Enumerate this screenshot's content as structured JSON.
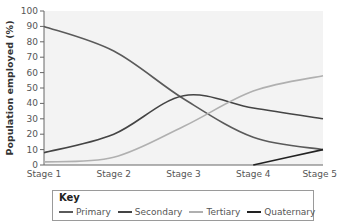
{
  "chart_data": {
    "type": "line",
    "title": "",
    "xlabel": "",
    "ylabel": "Population employed (%)",
    "ylim": [
      0,
      100
    ],
    "yticks": [
      0,
      10,
      20,
      30,
      40,
      50,
      60,
      70,
      80,
      90,
      100
    ],
    "categories": [
      "Stage 1",
      "Stage 2",
      "Stage 3",
      "Stage 4",
      "Stage 5"
    ],
    "grid": false,
    "legend_position": "bottom",
    "legend_title": "Key",
    "series": [
      {
        "name": "Primary",
        "color": "#5a5a5a",
        "values": [
          90,
          74,
          43,
          18,
          10
        ]
      },
      {
        "name": "Secondary",
        "color": "#444444",
        "values": [
          8,
          20,
          45,
          37,
          30
        ]
      },
      {
        "name": "Tertiary",
        "color": "#b0b0b0",
        "values": [
          2,
          5,
          25,
          48,
          58
        ]
      },
      {
        "name": "Quaternary",
        "color": "#222222",
        "values": [
          null,
          null,
          null,
          0,
          10
        ]
      }
    ]
  },
  "key": {
    "title": "Key",
    "items": [
      {
        "label": "Primary",
        "color": "#5a5a5a"
      },
      {
        "label": "Secondary",
        "color": "#444444"
      },
      {
        "label": "Tertiary",
        "color": "#b0b0b0"
      },
      {
        "label": "Quaternary",
        "color": "#222222"
      }
    ]
  }
}
